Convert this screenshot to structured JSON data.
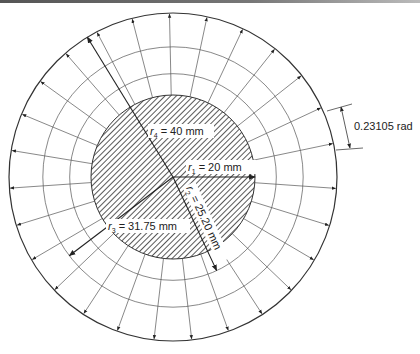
{
  "figure": {
    "center": {
      "x": 173,
      "y": 177
    },
    "scale_px_per_mm": 4.1,
    "radii_mm": {
      "r1": 20,
      "r2": 25.2,
      "r3": 31.75,
      "r4": 40
    },
    "ray_angle_step_rad": 0.23105,
    "ray_count": 27,
    "ray_start_offset_deg": 4,
    "colors": {
      "line": "#333333",
      "grid": "#555555",
      "hatch": "#222222",
      "background": "#ffffff"
    }
  },
  "labels": {
    "r4": {
      "symbol": "r",
      "sub": "4",
      "text": " = 40 mm"
    },
    "r1": {
      "symbol": "r",
      "sub": "1",
      "text": " = 20 mm"
    },
    "r2": {
      "symbol": "r",
      "sub": "2",
      "text": " = 25.20 mm"
    },
    "r3": {
      "symbol": "r",
      "sub": "3",
      "text": " = 31.75 mm"
    },
    "angle": "0.23105 rad"
  }
}
